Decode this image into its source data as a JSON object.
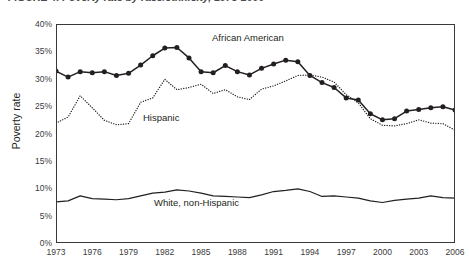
{
  "figure": {
    "title": "FIGURE 4. Poverty rate by race/ethnicity, 1973-2006",
    "title_clipped": true
  },
  "axes": {
    "y_title": "Poverty rate",
    "y_ticks": [
      "40%",
      "35%",
      "30%",
      "25%",
      "20%",
      "15%",
      "10%",
      "5%",
      "0%"
    ],
    "x_ticks": [
      "1973",
      "1976",
      "1979",
      "1982",
      "1985",
      "1988",
      "1991",
      "1994",
      "1997",
      "2000",
      "2003",
      "2006"
    ]
  },
  "series_labels": {
    "african_american": "African American",
    "hispanic": "Hispanic",
    "white": "White, non-Hispanic"
  },
  "colors": {
    "line": "#231f20",
    "frame": "#3a3a3a",
    "text": "#231f20",
    "tick_text": "#3b3b3b"
  },
  "chart_data": {
    "type": "line",
    "title": "FIGURE 4. Poverty rate by race/ethnicity, 1973-2006",
    "xlabel": "",
    "ylabel": "Poverty rate",
    "xlim": [
      1973,
      2006
    ],
    "ylim": [
      0,
      40
    ],
    "ytick_values": [
      0,
      5,
      10,
      15,
      20,
      25,
      30,
      35,
      40
    ],
    "ytick_format": "percent",
    "xtick_values": [
      1973,
      1976,
      1979,
      1982,
      1985,
      1988,
      1991,
      1994,
      1997,
      2000,
      2003,
      2006
    ],
    "grid": false,
    "legend": "inline-annotations",
    "x": [
      1973,
      1974,
      1975,
      1976,
      1977,
      1978,
      1979,
      1980,
      1981,
      1982,
      1983,
      1984,
      1985,
      1986,
      1987,
      1988,
      1989,
      1990,
      1991,
      1992,
      1993,
      1994,
      1995,
      1996,
      1997,
      1998,
      1999,
      2000,
      2001,
      2002,
      2003,
      2004,
      2005,
      2006
    ],
    "series": [
      {
        "name": "African American",
        "style": "solid-with-markers",
        "values": [
          31.4,
          30.3,
          31.3,
          31.1,
          31.3,
          30.6,
          31.0,
          32.5,
          34.2,
          35.6,
          35.7,
          33.8,
          31.3,
          31.1,
          32.4,
          31.3,
          30.7,
          31.9,
          32.7,
          33.4,
          33.1,
          30.6,
          29.3,
          28.4,
          26.5,
          26.1,
          23.6,
          22.5,
          22.7,
          24.1,
          24.4,
          24.7,
          24.9,
          24.3
        ]
      },
      {
        "name": "Hispanic",
        "style": "dotted",
        "values": [
          21.9,
          23.0,
          26.9,
          24.7,
          22.4,
          21.6,
          21.8,
          25.7,
          26.5,
          29.9,
          28.0,
          28.4,
          29.0,
          27.3,
          28.0,
          26.7,
          26.2,
          28.1,
          28.7,
          29.6,
          30.6,
          30.7,
          30.3,
          29.4,
          27.1,
          25.6,
          22.7,
          21.5,
          21.4,
          21.8,
          22.5,
          21.9,
          21.8,
          20.6
        ]
      },
      {
        "name": "White, non-Hispanic",
        "style": "solid",
        "values": [
          7.5,
          7.7,
          8.6,
          8.1,
          8.0,
          7.9,
          8.1,
          8.6,
          9.1,
          9.3,
          9.7,
          9.5,
          9.1,
          8.6,
          8.5,
          8.4,
          8.3,
          8.8,
          9.4,
          9.6,
          9.9,
          9.4,
          8.5,
          8.6,
          8.4,
          8.2,
          7.7,
          7.4,
          7.8,
          8.0,
          8.2,
          8.6,
          8.3,
          8.2
        ]
      }
    ]
  }
}
